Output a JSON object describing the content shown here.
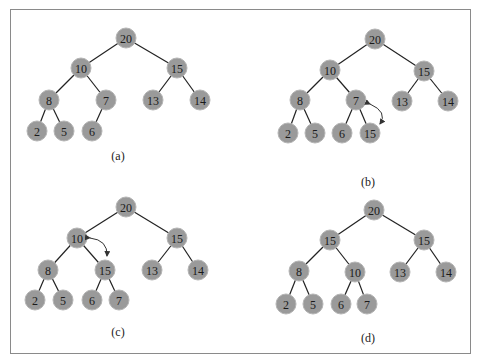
{
  "figure": {
    "panels": [
      {
        "id": "a",
        "caption": "(a)",
        "caption_pos": [
          118,
          160
        ],
        "nodes": [
          {
            "v": "20",
            "x": 126,
            "y": 38
          },
          {
            "v": "10",
            "x": 81,
            "y": 68
          },
          {
            "v": "15",
            "x": 177,
            "y": 68
          },
          {
            "v": "8",
            "x": 49,
            "y": 100
          },
          {
            "v": "7",
            "x": 106,
            "y": 100
          },
          {
            "v": "13",
            "x": 153,
            "y": 100
          },
          {
            "v": "14",
            "x": 200,
            "y": 100
          },
          {
            "v": "2",
            "x": 37,
            "y": 131
          },
          {
            "v": "5",
            "x": 64,
            "y": 131
          },
          {
            "v": "6",
            "x": 92,
            "y": 131
          }
        ],
        "edges": [
          [
            0,
            1
          ],
          [
            0,
            2
          ],
          [
            1,
            3
          ],
          [
            1,
            4
          ],
          [
            2,
            5
          ],
          [
            2,
            6
          ],
          [
            3,
            7
          ],
          [
            3,
            8
          ],
          [
            4,
            9
          ]
        ],
        "swap_arrow": null
      },
      {
        "id": "b",
        "caption": "(b)",
        "caption_pos": [
          368,
          186
        ],
        "nodes": [
          {
            "v": "20",
            "x": 375,
            "y": 39
          },
          {
            "v": "10",
            "x": 330,
            "y": 70
          },
          {
            "v": "15",
            "x": 424,
            "y": 71
          },
          {
            "v": "8",
            "x": 300,
            "y": 100
          },
          {
            "v": "7",
            "x": 356,
            "y": 100
          },
          {
            "v": "13",
            "x": 402,
            "y": 101
          },
          {
            "v": "14",
            "x": 448,
            "y": 101
          },
          {
            "v": "2",
            "x": 288,
            "y": 133
          },
          {
            "v": "5",
            "x": 315,
            "y": 133
          },
          {
            "v": "6",
            "x": 342,
            "y": 133
          },
          {
            "v": "15",
            "x": 370,
            "y": 133
          }
        ],
        "edges": [
          [
            0,
            1
          ],
          [
            0,
            2
          ],
          [
            1,
            3
          ],
          [
            1,
            4
          ],
          [
            2,
            5
          ],
          [
            2,
            6
          ],
          [
            3,
            7
          ],
          [
            3,
            8
          ],
          [
            4,
            9
          ],
          [
            4,
            10
          ]
        ],
        "swap_arrow": {
          "from": [
            370,
            104
          ],
          "ctrl": [
            388,
            112
          ],
          "to": [
            380,
            124
          ]
        }
      },
      {
        "id": "c",
        "caption": "(c)",
        "caption_pos": [
          118,
          336
        ],
        "nodes": [
          {
            "v": "20",
            "x": 126,
            "y": 207
          },
          {
            "v": "10",
            "x": 77,
            "y": 238
          },
          {
            "v": "15",
            "x": 177,
            "y": 238
          },
          {
            "v": "8",
            "x": 48,
            "y": 270
          },
          {
            "v": "15",
            "x": 105,
            "y": 270
          },
          {
            "v": "13",
            "x": 152,
            "y": 270
          },
          {
            "v": "14",
            "x": 198,
            "y": 270
          },
          {
            "v": "2",
            "x": 35,
            "y": 300
          },
          {
            "v": "5",
            "x": 63,
            "y": 300
          },
          {
            "v": "6",
            "x": 92,
            "y": 300
          },
          {
            "v": "7",
            "x": 119,
            "y": 300
          }
        ],
        "edges": [
          [
            0,
            1
          ],
          [
            0,
            2
          ],
          [
            1,
            3
          ],
          [
            1,
            4
          ],
          [
            2,
            5
          ],
          [
            2,
            6
          ],
          [
            3,
            7
          ],
          [
            3,
            8
          ],
          [
            4,
            9
          ],
          [
            4,
            10
          ]
        ],
        "swap_arrow": {
          "from": [
            90,
            238
          ],
          "ctrl": [
            108,
            240
          ],
          "to": [
            107,
            256
          ]
        }
      },
      {
        "id": "d",
        "caption": "(d)",
        "caption_pos": [
          368,
          342
        ],
        "nodes": [
          {
            "v": "20",
            "x": 374,
            "y": 210
          },
          {
            "v": "15",
            "x": 330,
            "y": 240
          },
          {
            "v": "15",
            "x": 424,
            "y": 240
          },
          {
            "v": "8",
            "x": 299,
            "y": 271
          },
          {
            "v": "10",
            "x": 355,
            "y": 272
          },
          {
            "v": "13",
            "x": 400,
            "y": 272
          },
          {
            "v": "14",
            "x": 446,
            "y": 272
          },
          {
            "v": "2",
            "x": 286,
            "y": 304
          },
          {
            "v": "5",
            "x": 313,
            "y": 304
          },
          {
            "v": "6",
            "x": 341,
            "y": 304
          },
          {
            "v": "7",
            "x": 367,
            "y": 304
          }
        ],
        "edges": [
          [
            0,
            1
          ],
          [
            0,
            2
          ],
          [
            1,
            3
          ],
          [
            1,
            4
          ],
          [
            2,
            5
          ],
          [
            2,
            6
          ],
          [
            3,
            7
          ],
          [
            3,
            8
          ],
          [
            4,
            9
          ],
          [
            4,
            10
          ]
        ],
        "swap_arrow": null
      }
    ],
    "node_radius": 10,
    "colors": {
      "node_fill": "#9a9a9a",
      "edge": "#222222",
      "border": "#8a8a8a"
    }
  }
}
